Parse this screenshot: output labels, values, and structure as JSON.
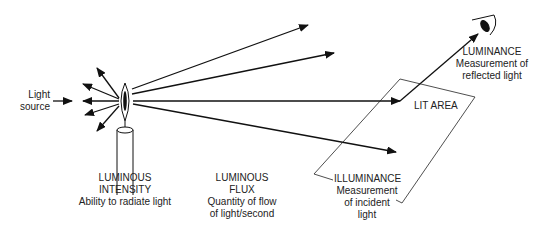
{
  "diagram": {
    "light_source": {
      "line1": "Light",
      "line2": "source"
    },
    "luminous_intensity": {
      "title1": "LUMINOUS",
      "title2": "INTENSITY",
      "desc": "Ability to radiate light"
    },
    "luminous_flux": {
      "title1": "LUMINOUS",
      "title2": "FLUX",
      "desc1": "Quantity of flow",
      "desc2": "of light/second"
    },
    "illuminance": {
      "title": "ILLUMINANCE",
      "desc1": "Measurement",
      "desc2": "of incident",
      "desc3": "light"
    },
    "luminance": {
      "title": "LUMINANCE",
      "desc1": "Measurement of",
      "desc2": "reflected light"
    },
    "lit_area": {
      "label": "LIT AREA"
    }
  }
}
